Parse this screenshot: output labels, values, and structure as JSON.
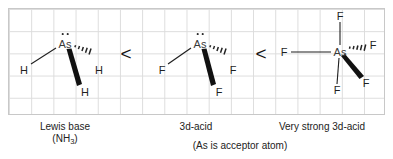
{
  "diagram": {
    "grid": {
      "visible": true,
      "line_color": "#dcdcdc",
      "border_color": "#c8c8c8",
      "cell_size_px": 22
    },
    "ink_color": "#1f1f1f",
    "central_atom_symbol": "As"
  },
  "structures": [
    {
      "id": "ash3",
      "center_label": "As",
      "has_lone_pair": true,
      "lone_pair_count": 2,
      "substituent_symbol": "H",
      "substituents": [
        {
          "label": "H",
          "bond_style": "plain",
          "position": "left"
        },
        {
          "label": "H",
          "bond_style": "hashed-wedge",
          "position": "right"
        },
        {
          "label": "H",
          "bond_style": "bold-wedge",
          "position": "bottom"
        }
      ],
      "caption_line1": "Lewis base",
      "caption_line2_prefix": "(NH",
      "caption_line2_sub": "3",
      "caption_line2_suffix": ")"
    },
    {
      "id": "asf3",
      "center_label": "As",
      "has_lone_pair": true,
      "lone_pair_count": 2,
      "substituent_symbol": "F",
      "substituents": [
        {
          "label": "F",
          "bond_style": "plain",
          "position": "left"
        },
        {
          "label": "F",
          "bond_style": "hashed-wedge",
          "position": "right"
        },
        {
          "label": "F",
          "bond_style": "bold-wedge",
          "position": "bottom"
        }
      ],
      "caption_line1": "3d-acid"
    },
    {
      "id": "asf5",
      "center_label": "As",
      "has_lone_pair": false,
      "lone_pair_count": 0,
      "substituent_symbol": "F",
      "substituents": [
        {
          "label": "F",
          "bond_style": "plain",
          "position": "top"
        },
        {
          "label": "F",
          "bond_style": "plain",
          "position": "left"
        },
        {
          "label": "F",
          "bond_style": "plain",
          "position": "bottom"
        },
        {
          "label": "F",
          "bond_style": "hashed-wedge",
          "position": "right"
        },
        {
          "label": "F",
          "bond_style": "bold-wedge",
          "position": "lower-right"
        }
      ],
      "caption_line1": "Very strong 3d-acid"
    }
  ],
  "operators": [
    {
      "symbol": "<",
      "meaning": "less-than"
    },
    {
      "symbol": "<",
      "meaning": "less-than"
    }
  ],
  "footnote": "(As is acceptor atom)"
}
